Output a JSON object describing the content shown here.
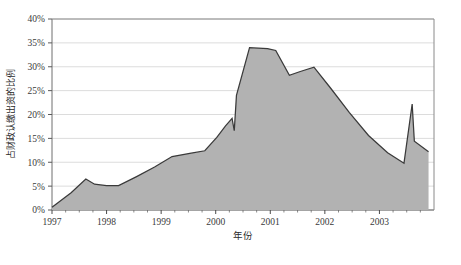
{
  "chart_data": {
    "type": "area",
    "title": "",
    "xlabel": "年份",
    "ylabel": "占财政认缴出资的比例",
    "xlim": [
      1997.0,
      2004.0
    ],
    "ylim": [
      0,
      40
    ],
    "grid": true,
    "legend": "none",
    "y_tick_labels": [
      "0%",
      "5%",
      "10%",
      "15%",
      "20%",
      "25%",
      "30%",
      "35%",
      "40%"
    ],
    "y_tick_values": [
      0,
      5,
      10,
      15,
      20,
      25,
      30,
      35,
      40
    ],
    "x_tick_labels": [
      "1997",
      "1998",
      "1999",
      "2000",
      "2001",
      "2002",
      "2003"
    ],
    "x_tick_values": [
      1997,
      1998,
      1999,
      2000,
      2001,
      2002,
      2003
    ],
    "series": [
      {
        "name": "占财政认缴出资的比例",
        "fill_color": "#b2b2b2",
        "line_color": "#3a3a3a",
        "x": [
          1997.0,
          1997.35,
          1997.62,
          1997.78,
          1998.0,
          1998.22,
          1998.55,
          1998.88,
          1999.2,
          1999.55,
          1999.8,
          2000.02,
          2000.18,
          2000.3,
          2000.34,
          2000.38,
          2000.62,
          2000.95,
          2001.1,
          2001.35,
          2001.55,
          2001.8,
          2002.1,
          2002.45,
          2002.8,
          2003.15,
          2003.45,
          2003.6,
          2003.64,
          2003.9
        ],
        "y": [
          0.6,
          3.6,
          6.5,
          5.4,
          5.1,
          5.1,
          7.0,
          9.0,
          11.2,
          11.9,
          12.4,
          15.2,
          17.6,
          19.2,
          16.6,
          24.0,
          34.0,
          33.8,
          33.4,
          28.2,
          29.0,
          29.9,
          25.6,
          20.4,
          15.6,
          12.0,
          9.8,
          22.2,
          14.4,
          12.2
        ]
      }
    ]
  }
}
